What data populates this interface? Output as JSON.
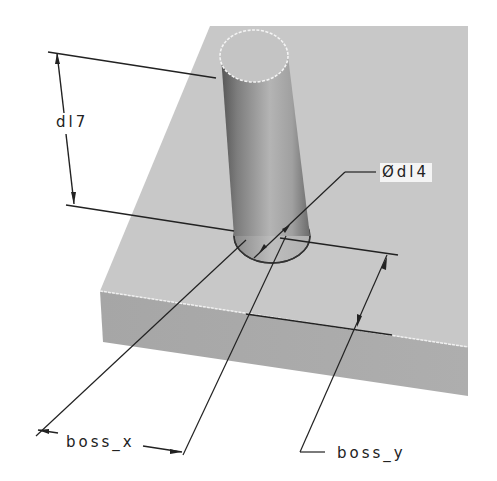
{
  "figure": {
    "type": "cad-isometric-model"
  },
  "colors": {
    "background": "#ffffff",
    "block_top": "#c9c9c9",
    "block_front": "#a9a9a9",
    "cylinder_dark": "#6e6e6e",
    "cylinder_light": "#cfcfcf",
    "edge_highlight": "#f2f2f2",
    "dimension_line": "#222222",
    "label_box": "#f4f4f4"
  },
  "dimensions": [
    {
      "id": "d17",
      "label": "d17",
      "meaning": "boss height"
    },
    {
      "id": "d14",
      "label": "Ød14",
      "meaning": "boss diameter"
    },
    {
      "id": "boss_x",
      "label": "boss_x",
      "meaning": "boss x-position"
    },
    {
      "id": "boss_y",
      "label": "boss_y",
      "meaning": "boss y-position"
    }
  ],
  "labels": {
    "d17": "dl7",
    "d14": "Ødl4",
    "boss_x": "boss_x",
    "boss_y": "boss_y"
  }
}
